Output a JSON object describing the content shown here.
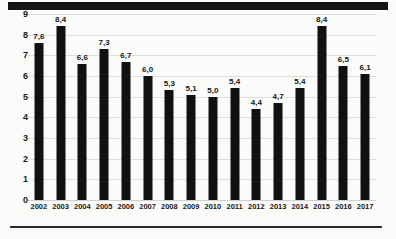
{
  "chart_data": {
    "type": "bar",
    "title": "",
    "subtitle": "",
    "xlabel": "",
    "ylabel": "",
    "categories": [
      "2002",
      "2003",
      "2004",
      "2005",
      "2006",
      "2007",
      "2008",
      "2009",
      "2010",
      "2011",
      "2012",
      "2013",
      "2014",
      "2015",
      "2016",
      "2017"
    ],
    "values": [
      7.6,
      8.4,
      6.6,
      7.3,
      6.7,
      6.0,
      5.3,
      5.1,
      5.0,
      5.4,
      4.4,
      4.7,
      5.4,
      8.4,
      6.5,
      6.1
    ],
    "value_labels": [
      "7,6",
      "8,4",
      "6,6",
      "7,3",
      "6,7",
      "6,0",
      "5,3",
      "5,1",
      "5,0",
      "5,4",
      "4,4",
      "4,7",
      "5,4",
      "8,4",
      "6,5",
      "6,1"
    ],
    "ylim": [
      0,
      9
    ],
    "y_ticks": [
      0,
      1,
      2,
      3,
      4,
      5,
      6,
      7,
      8,
      9
    ],
    "y_tick_labels": [
      "0",
      "1",
      "2",
      "3",
      "4",
      "5",
      "6",
      "7",
      "8",
      "9"
    ],
    "grid": true,
    "legend": null,
    "legend_position": "none",
    "series": [
      {
        "name": "",
        "values": [
          7.6,
          8.4,
          6.6,
          7.3,
          6.7,
          6.0,
          5.3,
          5.1,
          5.0,
          5.4,
          4.4,
          4.7,
          5.4,
          8.4,
          6.5,
          6.1
        ]
      }
    ],
    "colors": {
      "bar": "#111111",
      "grid": "#dedede",
      "text": "#1a1a1a",
      "background": "#fbfbf9",
      "rule": "#141414"
    }
  }
}
